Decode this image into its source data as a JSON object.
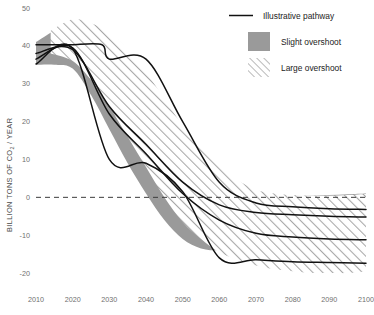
{
  "chart_data": {
    "type": "area",
    "title": "",
    "xlabel": "",
    "ylabel": "BILLION TONS OF CO",
    "ylabel_sub": "2",
    "ylabel_tail": " / YEAR",
    "xlim": [
      2010,
      2100
    ],
    "ylim": [
      -25,
      50
    ],
    "grid": false,
    "zero_line": true,
    "xticks": [
      2010,
      2020,
      2030,
      2040,
      2050,
      2060,
      2070,
      2080,
      2090,
      2100
    ],
    "yticks": [
      50,
      40,
      30,
      20,
      10,
      0,
      -10,
      -20
    ],
    "legend_position": "top-right",
    "legend": [
      {
        "label": "Illustrative pathway",
        "kind": "line",
        "color": "#111111"
      },
      {
        "label": "Slight overshoot",
        "kind": "fill",
        "color": "#9a9a9a"
      },
      {
        "label": "Large overshoot",
        "kind": "hatch",
        "color": "#9a9a9a"
      }
    ],
    "bands": [
      {
        "name": "Slight overshoot",
        "style": "fill",
        "color": "#9a9a9a",
        "x": [
          2010,
          2015,
          2020,
          2025,
          2030,
          2035,
          2040,
          2045,
          2050,
          2055,
          2060,
          2065,
          2070,
          2075,
          2080,
          2085,
          2090,
          2095,
          2100
        ],
        "upper": [
          41.0,
          44.0,
          46.0,
          44.0,
          39.0,
          32.0,
          24.0,
          17.0,
          11.0,
          7.0,
          4.0,
          2.2,
          1.0,
          0.6,
          0.4,
          0.4,
          0.6,
          0.8,
          1.0
        ],
        "lower": [
          35.0,
          35.0,
          34.0,
          27.0,
          18.0,
          9.0,
          1.0,
          -6.0,
          -11.0,
          -13.5,
          -14.0,
          -13.5,
          -13.0,
          -12.5,
          -12.0,
          -11.5,
          -11.0,
          -10.5,
          -10.0
        ]
      },
      {
        "name": "Large overshoot",
        "style": "hatch",
        "color": "#9a9a9a",
        "x": [
          2014,
          2020,
          2025,
          2030,
          2035,
          2040,
          2045,
          2050,
          2055,
          2060,
          2065,
          2070,
          2075,
          2080,
          2085,
          2090,
          2095,
          2100
        ],
        "upper": [
          44.0,
          47.0,
          46.0,
          43.5,
          39.0,
          33.0,
          26.0,
          19.0,
          13.0,
          8.0,
          4.5,
          2.0,
          1.0,
          0.6,
          0.4,
          0.4,
          0.6,
          0.9
        ],
        "lower": [
          38.0,
          36.0,
          31.0,
          24.0,
          16.0,
          8.0,
          0.0,
          -6.5,
          -11.0,
          -14.5,
          -16.5,
          -18.0,
          -19.0,
          -19.5,
          -20.0,
          -20.0,
          -20.0,
          -19.5
        ]
      }
    ],
    "series": [
      {
        "name": "Illustrative pathway 1",
        "color": "#111111",
        "x": [
          2010,
          2018,
          2020,
          2028,
          2030,
          2040,
          2050,
          2060,
          2070,
          2080,
          2090,
          2100
        ],
        "y": [
          40.3,
          40.3,
          40.3,
          40.3,
          36.5,
          36.5,
          20.0,
          4.0,
          -1.5,
          -2.5,
          -3.0,
          -3.2
        ]
      },
      {
        "name": "Illustrative pathway 2",
        "color": "#111111",
        "x": [
          2010,
          2020,
          2030,
          2040,
          2050,
          2060,
          2070,
          2080,
          2090,
          2100
        ],
        "y": [
          38.0,
          39.0,
          24.0,
          14.0,
          4.0,
          -2.0,
          -4.0,
          -4.6,
          -5.0,
          -5.2
        ]
      },
      {
        "name": "Illustrative pathway 3",
        "color": "#111111",
        "x": [
          2010,
          2020,
          2030,
          2040,
          2050,
          2060,
          2070,
          2080,
          2090,
          2100
        ],
        "y": [
          36.5,
          39.5,
          22.0,
          11.5,
          1.0,
          -6.0,
          -9.5,
          -10.5,
          -11.0,
          -11.2
        ]
      },
      {
        "name": "Illustrative pathway 4",
        "color": "#111111",
        "x": [
          2010,
          2020,
          2030,
          2040,
          2050,
          2060,
          2070,
          2080,
          2090,
          2100
        ],
        "y": [
          35.2,
          39.2,
          10.0,
          9.0,
          1.5,
          -16.0,
          -16.5,
          -17.0,
          -17.2,
          -17.4
        ]
      }
    ]
  }
}
